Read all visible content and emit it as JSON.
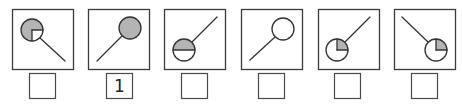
{
  "colors": {
    "fill": "#b4b4b4",
    "stroke": "#333333",
    "background": "#ffffff"
  },
  "panels": [
    {
      "id": 1,
      "circle": "gray with white bottom-right quarter",
      "stick_direction": "down-right",
      "answer": ""
    },
    {
      "id": 2,
      "circle": "fully gray",
      "stick_direction": "down-left",
      "answer": "1"
    },
    {
      "id": 3,
      "circle": "top half gray",
      "stick_direction": "up-right",
      "answer": ""
    },
    {
      "id": 4,
      "circle": "white",
      "stick_direction": "down-left",
      "answer": ""
    },
    {
      "id": 5,
      "circle": "gray top-right quarter",
      "stick_direction": "up-right",
      "answer": ""
    },
    {
      "id": 6,
      "circle": "gray top-right quarter",
      "stick_direction": "up-left",
      "answer": ""
    }
  ]
}
